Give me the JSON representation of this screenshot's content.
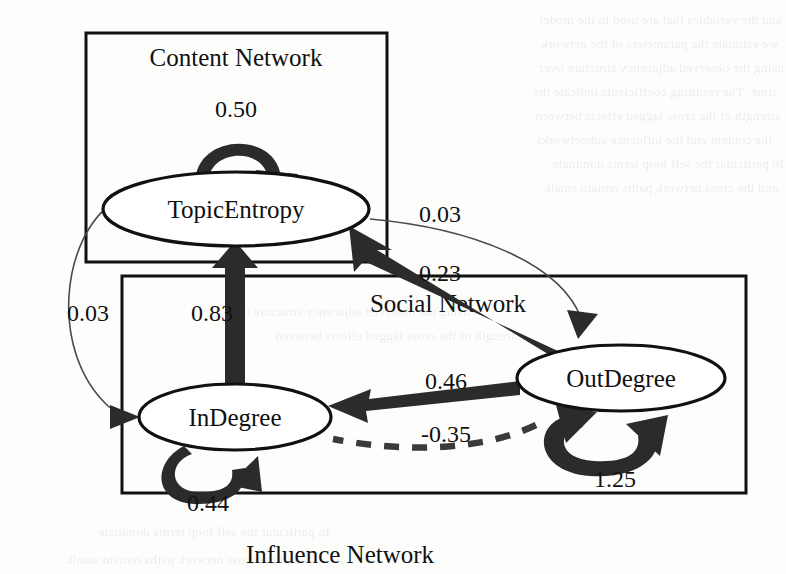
{
  "figure": {
    "type": "path-diagram"
  },
  "containers": [
    {
      "id": "content-network",
      "label": "Content Network",
      "label_position": "inside-top"
    },
    {
      "id": "social-network",
      "label": "Social Network",
      "label_position": "inside-top"
    },
    {
      "id": "influence-network",
      "label": "Influence Network",
      "label_position": "outside-bottom"
    }
  ],
  "nodes": [
    {
      "id": "topic-entropy",
      "label": "TopicEntropy",
      "container": "content-network"
    },
    {
      "id": "in-degree",
      "label": "InDegree",
      "container": "influence-network"
    },
    {
      "id": "out-degree",
      "label": "OutDegree",
      "container": "influence-network"
    }
  ],
  "edges": [
    {
      "id": "e-te-self",
      "from": "TopicEntropy",
      "to": "TopicEntropy",
      "weight": "0.50",
      "style": "thick-solid",
      "kind": "self-loop"
    },
    {
      "id": "e-in-self",
      "from": "InDegree",
      "to": "InDegree",
      "weight": "0.44",
      "style": "thick-solid",
      "kind": "self-loop"
    },
    {
      "id": "e-out-self",
      "from": "OutDegree",
      "to": "OutDegree",
      "weight": "1.25",
      "style": "thick-solid",
      "kind": "self-loop"
    },
    {
      "id": "e-in-te",
      "from": "InDegree",
      "to": "TopicEntropy",
      "weight": "0.83",
      "style": "thick-solid",
      "kind": "directed"
    },
    {
      "id": "e-out-te",
      "from": "OutDegree",
      "to": "TopicEntropy",
      "weight": "0.23",
      "style": "thick-solid",
      "kind": "directed"
    },
    {
      "id": "e-te-out",
      "from": "TopicEntropy",
      "to": "OutDegree",
      "weight": "0.03",
      "style": "thin-solid",
      "kind": "directed"
    },
    {
      "id": "e-te-in",
      "from": "TopicEntropy",
      "to": "InDegree",
      "weight": "0.03",
      "style": "thin-solid",
      "kind": "directed"
    },
    {
      "id": "e-out-in",
      "from": "OutDegree",
      "to": "InDegree",
      "weight": "0.46",
      "style": "thick-solid",
      "kind": "directed"
    },
    {
      "id": "e-out-in-neg",
      "from": "OutDegree",
      "to": "InDegree",
      "weight": "-0.35",
      "style": "dashed",
      "kind": "directed"
    }
  ],
  "labels": {
    "content_network": "Content Network",
    "social_network": "Social Network",
    "influence_network": "Influence Network",
    "topic_entropy": "TopicEntropy",
    "in_degree": "InDegree",
    "out_degree": "OutDegree",
    "w_te_self": "0.50",
    "w_in_self": "0.44",
    "w_out_self": "1.25",
    "w_in_te": "0.83",
    "w_out_te": "0.23",
    "w_te_out": "0.03",
    "w_te_in": "0.03",
    "w_out_in": "0.46",
    "w_out_in_neg": "-0.35"
  },
  "colors": {
    "page_background": "#fdfdfc",
    "stroke": "#111111",
    "thick_edge": "#2b2b2b",
    "thin_edge": "#4a4a4a",
    "dashed_edge": "#3a3a3a",
    "node_fill": "#ffffff"
  },
  "background_bleed": [
    "and the variables that are used in the model",
    "we estimate the parameters of the network",
    "using the observed adjacency structure over",
    "time. The resulting coefficients indicate the",
    "strength of the cross lagged effects between",
    "the content and the influence subnetworks.",
    "In particular the self loop terms dominate",
    "and the cross network paths remain small."
  ]
}
